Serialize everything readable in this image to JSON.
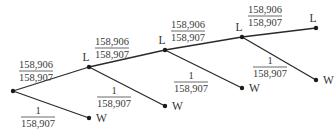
{
  "diagram": {
    "type": "probability-tree",
    "nodes": [
      {
        "id": "root",
        "label": ""
      },
      {
        "id": "L1",
        "label": "L"
      },
      {
        "id": "W1",
        "label": "W"
      },
      {
        "id": "L2",
        "label": "L"
      },
      {
        "id": "W2",
        "label": "W"
      },
      {
        "id": "L3",
        "label": "L"
      },
      {
        "id": "W3",
        "label": "W"
      },
      {
        "id": "L4",
        "label": "L"
      },
      {
        "id": "W4",
        "label": "W"
      }
    ],
    "edges": [
      {
        "from": "root",
        "to": "L1",
        "numerator": "158,906",
        "denominator": "158,907"
      },
      {
        "from": "root",
        "to": "W1",
        "numerator": "1",
        "denominator": "158,907"
      },
      {
        "from": "L1",
        "to": "L2",
        "numerator": "158,906",
        "denominator": "158,907"
      },
      {
        "from": "L1",
        "to": "W2",
        "numerator": "1",
        "denominator": "158,907"
      },
      {
        "from": "L2",
        "to": "L3",
        "numerator": "158,906",
        "denominator": "158,907"
      },
      {
        "from": "L2",
        "to": "W3",
        "numerator": "1",
        "denominator": "158,907"
      },
      {
        "from": "L3",
        "to": "L4",
        "numerator": "158,906",
        "denominator": "158,907"
      },
      {
        "from": "L3",
        "to": "W4",
        "numerator": "1",
        "denominator": "158,907"
      }
    ]
  }
}
